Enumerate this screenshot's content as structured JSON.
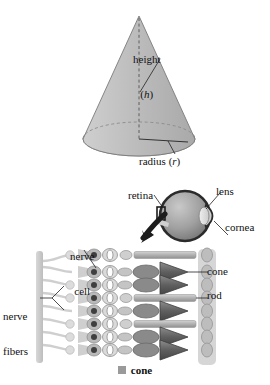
{
  "figure": {
    "title_present": false,
    "panels": [
      "cone-geometry",
      "eye-anatomy",
      "retina-photoreceptors"
    ]
  },
  "cone_panel": {
    "height_label_line1": "height",
    "height_label_line2_open": "(",
    "height_label_symbol": "h",
    "height_label_line2_close": ")",
    "radius_label_text": "radius (",
    "radius_label_symbol": "r",
    "radius_label_close": ")",
    "fill_color": "#b9b9b9",
    "stroke_color": "#6e6e6e"
  },
  "eye_panel": {
    "retina_label": "retina",
    "lens_label": "lens",
    "cornea_label": "cornea",
    "sphere_color": "#9d9d9d",
    "outline_color": "#2b2b2b",
    "arrow_color": "#1c1c1c"
  },
  "retina_panel": {
    "nerve_cell_label_line1": "nerve",
    "nerve_cell_label_line2": "cell",
    "nerve_fibers_label_line1": "nerve",
    "nerve_fibers_label_line2": "fibers",
    "cone_callout": "cone",
    "rod_callout": "rod",
    "rows": [
      {
        "type": "rod",
        "y": 255
      },
      {
        "type": "cone",
        "y": 272
      },
      {
        "type": "cone",
        "y": 285
      },
      {
        "type": "rod",
        "y": 298
      },
      {
        "type": "cone",
        "y": 311
      },
      {
        "type": "rod",
        "y": 324
      },
      {
        "type": "cone",
        "y": 337
      },
      {
        "type": "cone",
        "y": 350
      }
    ],
    "cone_color": "#6f6f6f",
    "rod_color": "#b5b5b5",
    "fiber_color": "#c9c9c9"
  },
  "legend": {
    "swatch_color": "#9a9a9a",
    "label": "cone"
  }
}
